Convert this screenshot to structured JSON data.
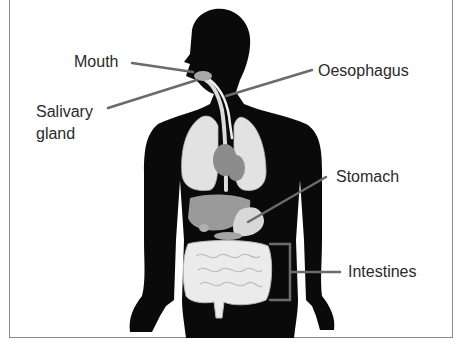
{
  "diagram": {
    "labels": [
      {
        "id": "mouth",
        "text": "Mouth"
      },
      {
        "id": "salivary",
        "text_line1": "Salivary",
        "text_line2": "gland"
      },
      {
        "id": "oesophagus",
        "text": "Oesophagus"
      },
      {
        "id": "stomach",
        "text": "Stomach"
      },
      {
        "id": "intestines",
        "text": "Intestines"
      }
    ],
    "colors": {
      "silhouette": "#0a0a0a",
      "lungs": "#e6e6e6",
      "organs": "#9a9a9a",
      "intestines": "#e8e8e8",
      "leader_lines": "#6b6b6b",
      "label_text": "#2a2a2a"
    }
  }
}
